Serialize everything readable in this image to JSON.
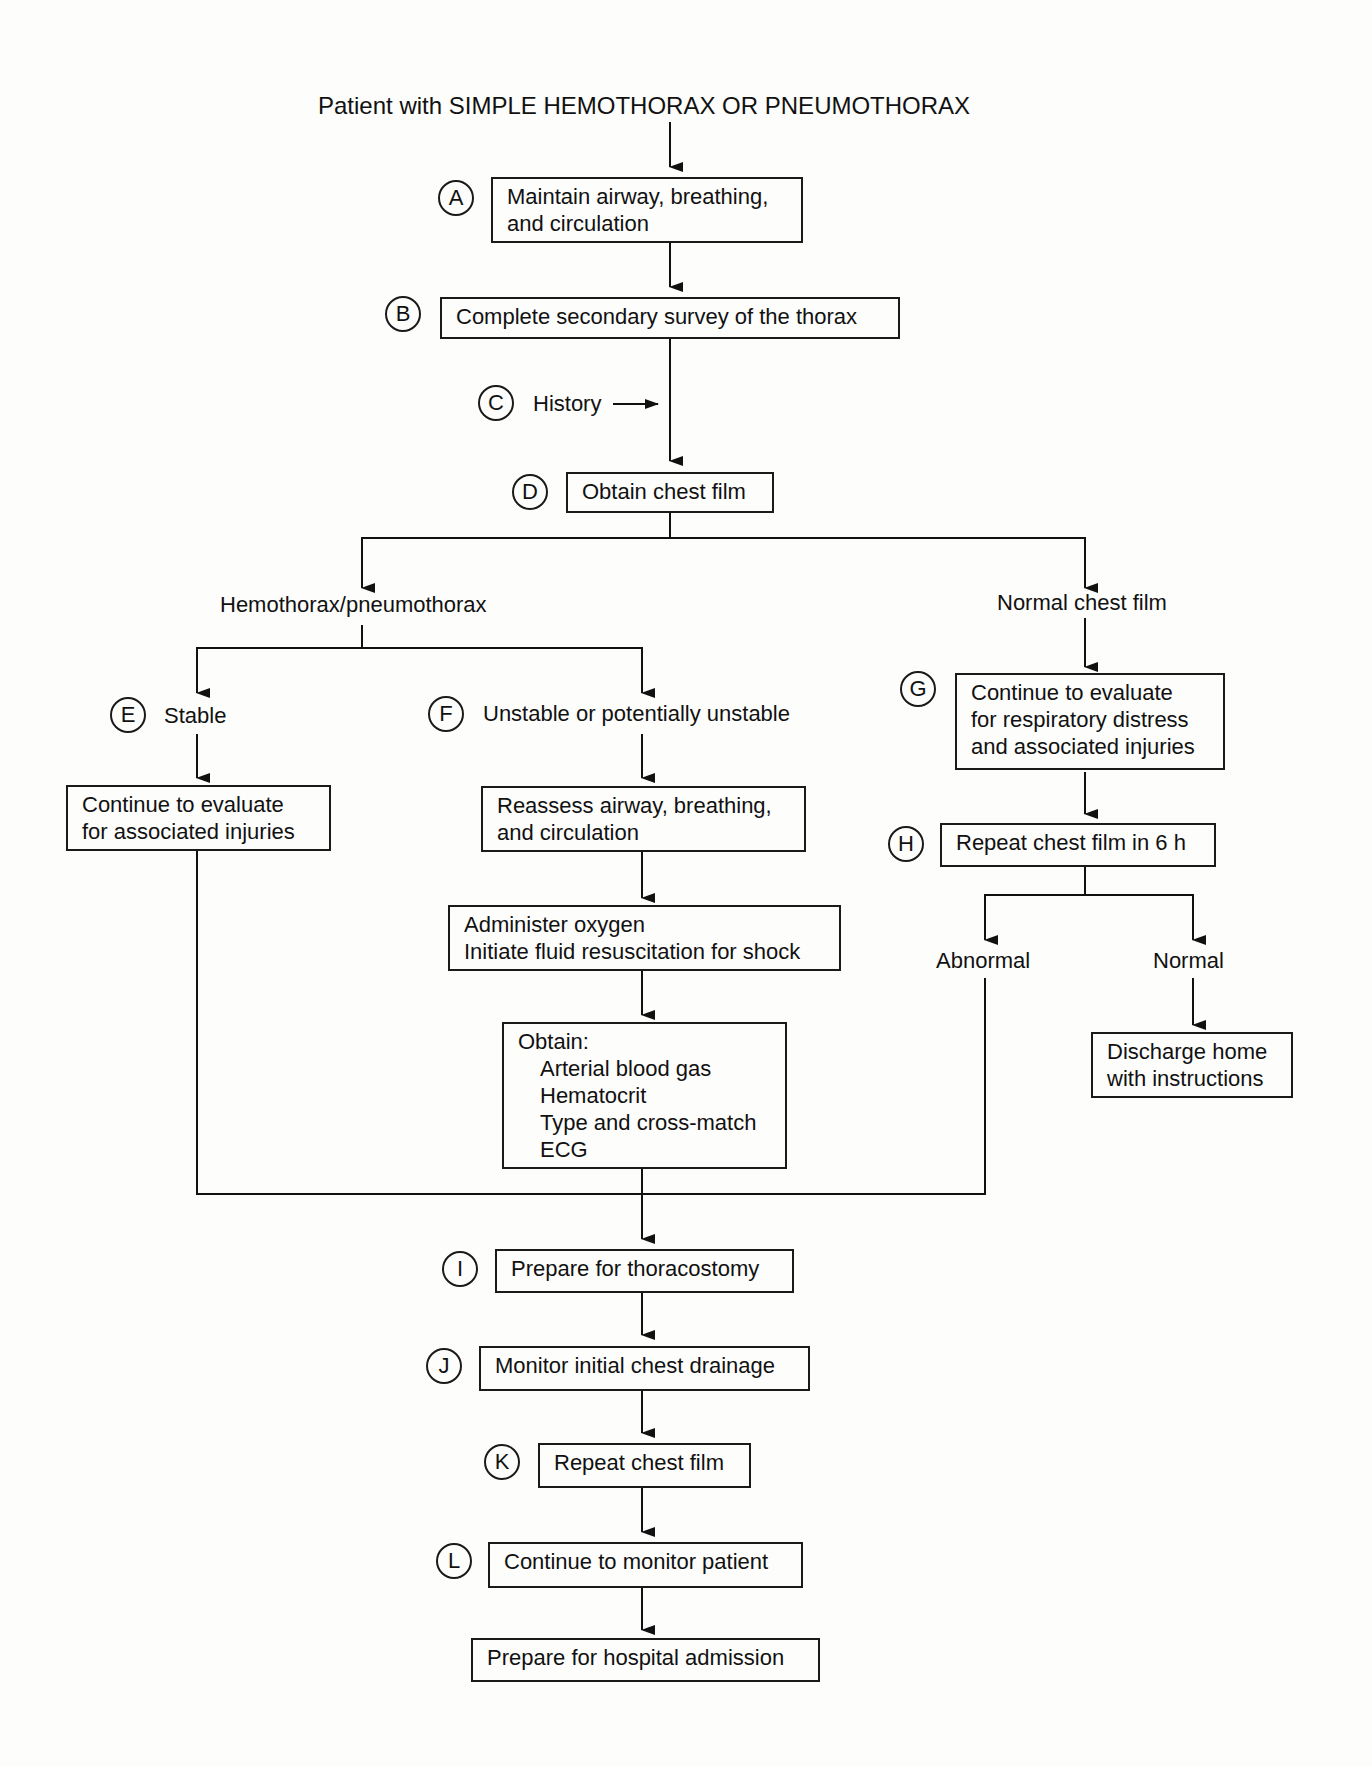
{
  "title": "Patient with SIMPLE HEMOTHORAX OR PNEUMOTHORAX",
  "steps": {
    "A": {
      "marker": "A",
      "lines": [
        "Maintain airway, breathing,",
        "and circulation"
      ]
    },
    "B": {
      "marker": "B",
      "text": "Complete secondary survey of the thorax"
    },
    "C": {
      "marker": "C",
      "text": "History"
    },
    "D": {
      "marker": "D",
      "text": "Obtain chest film"
    },
    "E": {
      "marker": "E",
      "text": "Stable"
    },
    "F": {
      "marker": "F",
      "text": "Unstable or potentially unstable"
    },
    "G": {
      "marker": "G",
      "lines": [
        "Continue to evaluate",
        "for respiratory distress",
        "and associated injuries"
      ]
    },
    "H": {
      "marker": "H",
      "text": "Repeat chest film in 6 h"
    },
    "I": {
      "marker": "I",
      "text": "Prepare for thoracostomy"
    },
    "J": {
      "marker": "J",
      "text": "Monitor initial chest drainage"
    },
    "K": {
      "marker": "K",
      "text": "Repeat chest film"
    },
    "L": {
      "marker": "L",
      "text": "Continue to monitor patient"
    }
  },
  "branches": {
    "hemo": "Hemothorax/pneumothorax",
    "normal": "Normal chest film",
    "abnormal": "Abnormal",
    "normal2": "Normal"
  },
  "boxes": {
    "stable_eval": [
      "Continue to evaluate",
      "for associated injuries"
    ],
    "reassess": [
      "Reassess airway, breathing,",
      "and circulation"
    ],
    "oxygen": [
      "Administer oxygen",
      "Initiate fluid resuscitation for shock"
    ],
    "obtain": {
      "header": "Obtain:",
      "items": [
        "Arterial blood gas",
        "Hematocrit",
        "Type and cross-match",
        "ECG"
      ]
    },
    "discharge": [
      "Discharge home",
      "with instructions"
    ],
    "admission": "Prepare for hospital admission"
  }
}
